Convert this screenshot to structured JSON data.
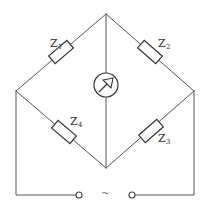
{
  "diagram": {
    "type": "AC impedance bridge circuit",
    "components": [
      {
        "id": "Z1",
        "label": "Z",
        "subscript": "1",
        "position": "upper-left arm"
      },
      {
        "id": "Z2",
        "label": "Z",
        "subscript": "2",
        "position": "upper-right arm"
      },
      {
        "id": "Z3",
        "label": "Z",
        "subscript": "3",
        "position": "lower-right arm"
      },
      {
        "id": "Z4",
        "label": "Z",
        "subscript": "4",
        "position": "lower-left arm"
      }
    ],
    "detector": {
      "symbol": "meter-with-arrow",
      "position": "center vertical branch"
    },
    "source": {
      "symbol": "~",
      "position": "bottom terminals"
    },
    "colors": {
      "wire": "#555555",
      "component": "#333333",
      "background": "#ffffff"
    }
  }
}
